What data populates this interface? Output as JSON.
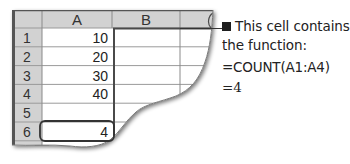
{
  "spreadsheet": {
    "column_headers": [
      "A",
      "B",
      "C"
    ],
    "rows": [
      {
        "row_label": "1",
        "a_value": "10"
      },
      {
        "row_label": "2",
        "a_value": "20"
      },
      {
        "row_label": "3",
        "a_value": "30"
      },
      {
        "row_label": "4",
        "a_value": "40"
      },
      {
        "row_label": "5",
        "a_value": ""
      },
      {
        "row_label": "6",
        "a_value": "4"
      },
      {
        "row_label": "7",
        "a_value": ""
      }
    ],
    "highlighted_cell": "A6"
  },
  "callout": {
    "bullet_icon": "square-bullet-icon",
    "line1": "This cell contains",
    "line2": "the function:",
    "formula": "=COUNT(A1:A4)",
    "result": "=4"
  },
  "colors": {
    "header_fill": "#d2d2d2",
    "grid_line": "#9a9a9a",
    "border_dark": "#4a4a4a",
    "text": "#222222"
  }
}
